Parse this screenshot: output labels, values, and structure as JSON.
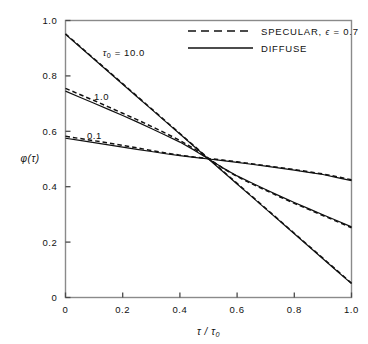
{
  "chart_data": {
    "type": "line",
    "title": "",
    "xlabel": "τ / τ₀",
    "ylabel": "φ(τ)",
    "xlim": [
      0,
      1.0
    ],
    "ylim": [
      0,
      1.0
    ],
    "grid": false,
    "legend_position": "top-right",
    "x_ticks": [
      "0",
      "0.2",
      "0.4",
      "0.6",
      "0.8",
      "1.0"
    ],
    "x_tick_values": [
      0,
      0.2,
      0.4,
      0.6,
      0.8,
      1.0
    ],
    "y_ticks": [
      "0",
      "0.2",
      "0.4",
      "0.6",
      "0.8",
      "1.0"
    ],
    "y_tick_values": [
      0,
      0.2,
      0.4,
      0.6,
      0.8,
      1.0
    ],
    "legend": [
      {
        "label": "SPECULAR, ϵ = 0.7",
        "style": "dashed"
      },
      {
        "label": "DIFFUSE",
        "style": "solid"
      }
    ],
    "curve_annotations": [
      {
        "text": "τ₀ = 10.0",
        "x": 0.13,
        "y": 0.885
      },
      {
        "text": "1.0",
        "x": 0.1,
        "y": 0.725
      },
      {
        "text": "0.1",
        "x": 0.075,
        "y": 0.585
      }
    ],
    "x": [
      0,
      0.05,
      0.1,
      0.15,
      0.2,
      0.25,
      0.3,
      0.35,
      0.4,
      0.45,
      0.5,
      0.55,
      0.6,
      0.65,
      0.7,
      0.75,
      0.8,
      0.85,
      0.9,
      0.95,
      1.0
    ],
    "series": [
      {
        "name": "DIFFUSE, τ₀ = 10.0",
        "style": "solid",
        "tau0": "10.0",
        "values": [
          0.95,
          0.905,
          0.86,
          0.815,
          0.77,
          0.725,
          0.68,
          0.635,
          0.59,
          0.545,
          0.5,
          0.455,
          0.41,
          0.365,
          0.32,
          0.275,
          0.23,
          0.185,
          0.14,
          0.095,
          0.05
        ]
      },
      {
        "name": "SPECULAR, τ₀ = 10.0",
        "style": "dashed",
        "tau0": "10.0",
        "values": [
          0.952,
          0.907,
          0.862,
          0.817,
          0.772,
          0.727,
          0.682,
          0.637,
          0.592,
          0.547,
          0.502,
          0.457,
          0.412,
          0.367,
          0.322,
          0.277,
          0.232,
          0.187,
          0.142,
          0.097,
          0.052
        ]
      },
      {
        "name": "DIFFUSE, τ₀ = 1.0",
        "style": "solid",
        "tau0": "1.0",
        "values": [
          0.745,
          0.723,
          0.701,
          0.679,
          0.657,
          0.634,
          0.61,
          0.586,
          0.561,
          0.532,
          0.5,
          0.468,
          0.439,
          0.414,
          0.39,
          0.366,
          0.343,
          0.321,
          0.299,
          0.277,
          0.255
        ]
      },
      {
        "name": "SPECULAR, τ₀ = 1.0",
        "style": "dashed",
        "tau0": "1.0",
        "values": [
          0.755,
          0.733,
          0.711,
          0.688,
          0.665,
          0.642,
          0.618,
          0.593,
          0.567,
          0.537,
          0.502,
          0.467,
          0.437,
          0.411,
          0.387,
          0.363,
          0.34,
          0.318,
          0.296,
          0.274,
          0.252
        ]
      },
      {
        "name": "DIFFUSE, τ₀ = 0.1",
        "style": "solid",
        "tau0": "0.1",
        "values": [
          0.575,
          0.567,
          0.559,
          0.551,
          0.543,
          0.535,
          0.527,
          0.519,
          0.512,
          0.506,
          0.5,
          0.494,
          0.488,
          0.481,
          0.474,
          0.467,
          0.46,
          0.452,
          0.444,
          0.433,
          0.422
        ]
      },
      {
        "name": "SPECULAR, τ₀ = 0.1",
        "style": "dashed",
        "tau0": "0.1",
        "values": [
          0.582,
          0.574,
          0.566,
          0.558,
          0.549,
          0.54,
          0.531,
          0.522,
          0.514,
          0.507,
          0.502,
          0.496,
          0.49,
          0.483,
          0.476,
          0.469,
          0.462,
          0.454,
          0.446,
          0.436,
          0.425
        ]
      }
    ]
  }
}
